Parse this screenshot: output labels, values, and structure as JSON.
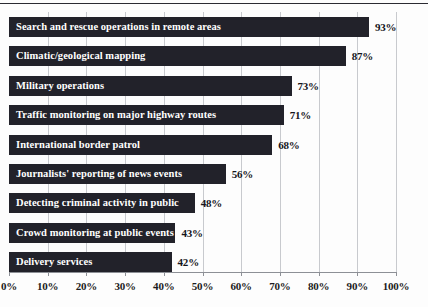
{
  "chart_data": {
    "type": "bar",
    "orientation": "horizontal",
    "title": "",
    "subtitle": "",
    "xlabel": "",
    "ylabel": "",
    "xlim": [
      0,
      100
    ],
    "grid": true,
    "legend": null,
    "value_suffix": "%",
    "categories": [
      "Search and rescue operations in remote areas",
      "Climatic/geological mapping",
      "Military operations",
      "Traffic monitoring on major highway routes",
      "International border patrol",
      "Journalists' reporting of news events",
      "Detecting criminal activity in public",
      "Crowd monitoring at public events",
      "Delivery services"
    ],
    "values": [
      93,
      87,
      73,
      71,
      68,
      56,
      48,
      43,
      42
    ],
    "value_labels": [
      "93%",
      "87%",
      "73%",
      "71%",
      "68%",
      "56%",
      "48%",
      "43%",
      "42%"
    ],
    "xticks": [
      0,
      10,
      20,
      30,
      40,
      50,
      60,
      70,
      80,
      90,
      100
    ],
    "xtick_labels": [
      "0%",
      "10%",
      "20%",
      "30%",
      "40%",
      "50%",
      "60%",
      "70%",
      "80%",
      "90%",
      "100%"
    ],
    "colors": {
      "bar": "#22222a",
      "bar_label": "#ffffff",
      "value_label": "#15151b",
      "gridline": "#c8cace",
      "axis": "#8d9096",
      "top_rule": "#2b2b32",
      "background": "#fdfdfd"
    }
  }
}
